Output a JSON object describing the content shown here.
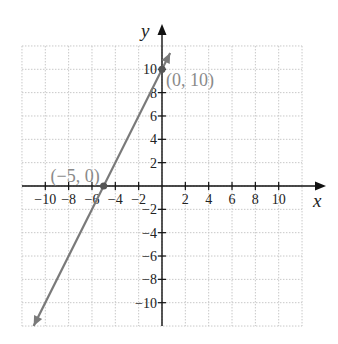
{
  "chart_data": {
    "type": "line",
    "title": "",
    "xlabel": "x",
    "ylabel": "y",
    "xlim": [
      -12,
      12
    ],
    "ylim": [
      -12,
      12
    ],
    "grid": true,
    "x_ticks": [
      -10,
      -8,
      -6,
      -4,
      -2,
      2,
      4,
      6,
      8,
      10
    ],
    "y_ticks": [
      -10,
      -8,
      -6,
      -4,
      -2,
      2,
      4,
      6,
      8,
      10
    ],
    "x_tick_labels": [
      "−10",
      "−8",
      "−6",
      "−4",
      "−2",
      "2",
      "4",
      "6",
      "8",
      "10"
    ],
    "y_tick_labels": [
      "−10",
      "−8",
      "−6",
      "−4",
      "−2",
      "2",
      "4",
      "6",
      "8",
      "10"
    ],
    "series": [
      {
        "name": "y = 2x + 10",
        "x": [
          -11,
          0.7
        ],
        "y": [
          -12,
          11.4
        ],
        "color": "#7a7a7a"
      }
    ],
    "points": [
      {
        "x": 0,
        "y": 10,
        "label": "(0, 10)"
      },
      {
        "x": -5,
        "y": 0,
        "label": "(−5, 0)"
      }
    ]
  },
  "colors": {
    "axis": "#111111",
    "line": "#7a7a7a",
    "grid": "#c8c8c8",
    "point": "#555555",
    "point_label": "#8a8a8a"
  }
}
